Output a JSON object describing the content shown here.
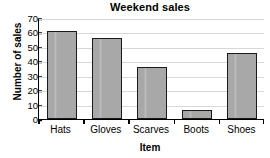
{
  "chart_data": {
    "type": "bar",
    "title": "Weekend sales",
    "xlabel": "Item",
    "ylabel": "Number of sales",
    "categories": [
      "Hats",
      "Gloves",
      "Scarves",
      "Boots",
      "Shoes"
    ],
    "values": [
      61,
      56,
      36,
      6,
      46
    ],
    "ylim": [
      0,
      70
    ],
    "yticks": [
      0,
      10,
      20,
      30,
      40,
      50,
      60,
      70
    ],
    "ytick_labels": [
      "0",
      "10",
      "20",
      "30",
      "40",
      "50",
      "60",
      "70"
    ],
    "grid": true,
    "grid_axis": "y",
    "legend": false,
    "bar_color": "#a8a8a8",
    "bar_edge_color": "#1a1a1a",
    "grid_color": "#d8d8d8",
    "axis_color": "#000000",
    "background": "#ffffff"
  }
}
